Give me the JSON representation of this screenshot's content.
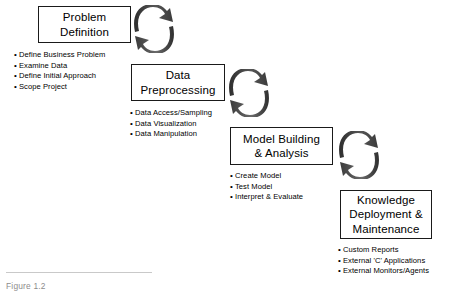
{
  "diagram": {
    "stages": [
      {
        "id": "problem-definition",
        "title_lines": [
          "Problem",
          "Definition"
        ],
        "bullets": [
          "Define Business Problem",
          "Examine Data",
          "Define Initial Approach",
          "Scope Project"
        ]
      },
      {
        "id": "data-preprocessing",
        "title_lines": [
          "Data",
          "Preprocessing"
        ],
        "bullets": [
          "Data Access/Sampling",
          "Data Visualization",
          "Data Manipulation"
        ]
      },
      {
        "id": "model-building-analysis",
        "title_lines": [
          "Model Building",
          "& Analysis"
        ],
        "bullets": [
          "Create Model",
          "Test Model",
          "Interpret & Evaluate"
        ]
      },
      {
        "id": "knowledge-deployment-maintenance",
        "title_lines": [
          "Knowledge",
          "Deployment &",
          "Maintenance"
        ],
        "bullets": [
          "Custom Reports",
          "External 'C' Applications",
          "External Monitors/Agents"
        ]
      }
    ],
    "connectors": [
      {
        "id": "cycle-arrow-1",
        "icon": "cycle-arrows-icon"
      },
      {
        "id": "cycle-arrow-2",
        "icon": "cycle-arrows-icon"
      },
      {
        "id": "cycle-arrow-3",
        "icon": "cycle-arrows-icon"
      }
    ],
    "bullet_marker": "•",
    "caption": "Figure 1.2",
    "colors": {
      "box_border": "#1a1a1a",
      "text": "#000000",
      "arrow_dark": "#3a3a3a",
      "arrow_light": "#7d7d7d",
      "background": "#ffffff",
      "caption_rule": "#c9c9c9"
    }
  }
}
